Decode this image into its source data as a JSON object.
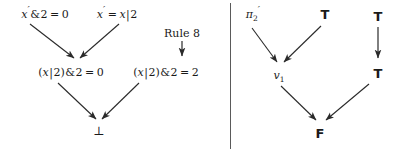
{
  "figure": {
    "background": "#ffffff",
    "ink_color": "#1a1a1a",
    "divider": {
      "x": 230,
      "top": 3,
      "bottom": 149
    }
  },
  "left_diagram": {
    "name": "bit-reasoning-contradiction-graph",
    "nodes": [
      {
        "id": "prem-left",
        "label": "x'&2 = 0",
        "parts": {
          "var": "x",
          "prime": "′",
          "op": "&",
          "num": "2",
          "eq": "=",
          "rhs": "0"
        },
        "x": 45,
        "y": 14
      },
      {
        "id": "prem-right",
        "label": "x' = x|2",
        "parts": {
          "var": "x",
          "prime": "′",
          "eq": "=",
          "rhs_var": "x",
          "bar": "|",
          "rhs_num": "2"
        },
        "x": 117,
        "y": 14
      },
      {
        "id": "concl-left",
        "label": "(x|2)&2 = 0",
        "parts": {
          "open": "(",
          "var": "x",
          "bar": "|",
          "num": "2",
          "close": ")",
          "op": "&",
          "num2": "2",
          "eq": "=",
          "rhs": "0"
        },
        "x": 71,
        "y": 72
      },
      {
        "id": "concl-right",
        "label": "(x|2)&2 = 2",
        "parts": {
          "open": "(",
          "var": "x",
          "bar": "|",
          "num": "2",
          "close": ")",
          "op": "&",
          "num2": "2",
          "eq": "=",
          "rhs": "2"
        },
        "x": 166,
        "y": 72
      },
      {
        "id": "bottom",
        "label": "⊥",
        "x": 99,
        "y": 131
      }
    ],
    "rule_annotation": {
      "label": "Rule 8",
      "x": 182,
      "y": 33,
      "arrow": {
        "x": 182,
        "y1": 42,
        "y2": 58,
        "direction": "down"
      }
    },
    "edges": [
      {
        "from": "prem-left",
        "to": "concl-left",
        "x1": 30,
        "y1": 24,
        "x2": 74,
        "y2": 60
      },
      {
        "from": "prem-right",
        "to": "concl-left",
        "x1": 119,
        "y1": 24,
        "x2": 79,
        "y2": 60
      },
      {
        "from": "concl-left",
        "to": "bottom",
        "x1": 58,
        "y1": 83,
        "x2": 96,
        "y2": 120
      },
      {
        "from": "concl-right",
        "to": "bottom",
        "x1": 139,
        "y1": 83,
        "x2": 102,
        "y2": 120
      }
    ]
  },
  "right_diagram": {
    "name": "truth-value-contradiction-graph",
    "nodes": [
      {
        "id": "pi2",
        "label": "π",
        "sub": "2",
        "prime": "′",
        "x": 253,
        "y": 14
      },
      {
        "id": "t-top",
        "label": "T",
        "x": 325,
        "y": 14
      },
      {
        "id": "v1",
        "label": "v",
        "sub": "1",
        "x": 279,
        "y": 75
      },
      {
        "id": "t-side-top",
        "label": "T",
        "x": 378,
        "y": 16
      },
      {
        "id": "t-side-bottom",
        "label": "T",
        "x": 378,
        "y": 73
      },
      {
        "id": "f-bottom",
        "label": "F",
        "x": 320,
        "y": 133
      }
    ],
    "side_arrow": {
      "x": 378,
      "y1": 28,
      "y2": 60,
      "direction": "down"
    },
    "edges": [
      {
        "from": "pi2",
        "to": "v1",
        "x1": 252,
        "y1": 28,
        "x2": 277,
        "y2": 63
      },
      {
        "from": "t-top",
        "to": "v1",
        "x1": 322,
        "y1": 26,
        "x2": 283,
        "y2": 63
      },
      {
        "from": "v1",
        "to": "f-bottom",
        "x1": 281,
        "y1": 86,
        "x2": 316,
        "y2": 121
      },
      {
        "from": "t-side-bottom",
        "to": "f-bottom",
        "x1": 370,
        "y1": 84,
        "x2": 325,
        "y2": 121
      }
    ]
  }
}
